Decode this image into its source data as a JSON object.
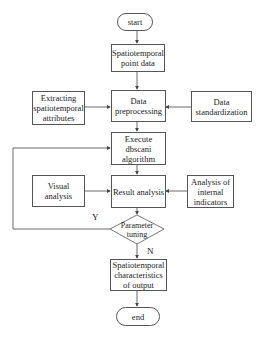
{
  "diagram": {
    "type": "flowchart",
    "nodes": {
      "start": "start",
      "point_data": "Spatiotemporal point data",
      "extracting": "Extracting spatiotemporal attributes",
      "preprocessing": "Data preprocessing",
      "standardization": "Data standardization",
      "execute": "Execute dbscani algorithm",
      "visual": "Visual analysis",
      "result": "Result analysis",
      "internal": "Analysis of internal indicators",
      "decision": "Parameter tuning",
      "output": "Spatiotemporal characteristics of output",
      "end": "end"
    },
    "edge_labels": {
      "yes": "Y",
      "no": "N"
    },
    "colors": {
      "line": "#444444",
      "border": "#555555",
      "background": "#ffffff"
    }
  }
}
